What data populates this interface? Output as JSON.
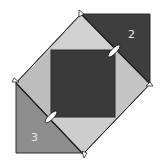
{
  "diagram": {
    "title": "",
    "colors": {
      "background": "#ffffff",
      "light_fabric": "#c9c9c9",
      "center_square": "#3a3a3a",
      "triangle_2": "#3e3e3e",
      "triangle_3": "#8d8d8d",
      "outline": "#2a2a2a",
      "pin": "#ffffff"
    },
    "labels": {
      "triangle_2": "2",
      "triangle_3": "3"
    },
    "pieces": [
      {
        "id": "outer-diamond",
        "shape": "square-on-point",
        "fill": "light"
      },
      {
        "id": "center-square",
        "shape": "square",
        "fill": "dark"
      },
      {
        "id": "triangle-2",
        "shape": "right-triangle",
        "position": "top-right",
        "label": "2"
      },
      {
        "id": "triangle-3",
        "shape": "right-triangle",
        "position": "bottom-left",
        "label": "3"
      }
    ],
    "markers": [
      {
        "type": "pin",
        "position": "upper-right seam"
      },
      {
        "type": "pin",
        "position": "lower-left seam"
      }
    ]
  }
}
